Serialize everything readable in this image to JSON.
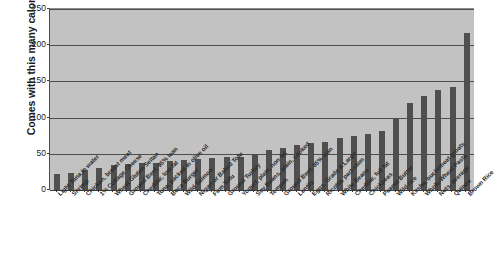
{
  "chart_data": {
    "type": "bar",
    "title": "",
    "subtitle": "",
    "xlabel": "",
    "ylabel": "Comes with this many calories",
    "ylim": [
      0,
      250
    ],
    "yticks": [
      0,
      50,
      100,
      150,
      200,
      250
    ],
    "grid": true,
    "legend": false,
    "legend_position": "none",
    "orientation": "vertical",
    "bar_color": "#4f4f4f",
    "plot_background": "#c2c2c2",
    "gridline_color": "#4d4d4d",
    "categories": [
      "Light Tuna in water",
      "Shrimp",
      "Chicken, breast meat",
      "1% Cottage Cheese",
      "Wheat Gluten Seitan",
      "Ground Beef, 95% lean",
      "Cheddar, low fat",
      "Tuna, packed in olive oil",
      "Boca Burger",
      "Wild Salmon",
      "Nigari or Baked Tofu",
      "Firm Tofu",
      "Ground Turkey",
      "Yogurt, plain, non-fat",
      "Soy Beans, plain, cooked",
      "Tempeh",
      "Ground Beef, 85% lean",
      "Lentils",
      "Eggs, Grade A Large",
      "Ricotta, part-skim",
      "White Beans",
      "Cheddar, full fat",
      "Chickpeas",
      "Peanut Butter",
      "Wild rice",
      "Kasha, buckwheat groats",
      "Whole-Wheat Pasta",
      "Nuts, average",
      "Quinoa",
      "Brown Rice"
    ],
    "values": [
      22,
      23,
      27,
      30,
      35,
      36,
      37,
      38,
      40,
      42,
      43,
      44,
      45,
      46,
      50,
      55,
      58,
      62,
      65,
      66,
      72,
      75,
      78,
      82,
      100,
      120,
      130,
      138,
      142,
      217
    ],
    "value_unit": "calories"
  }
}
